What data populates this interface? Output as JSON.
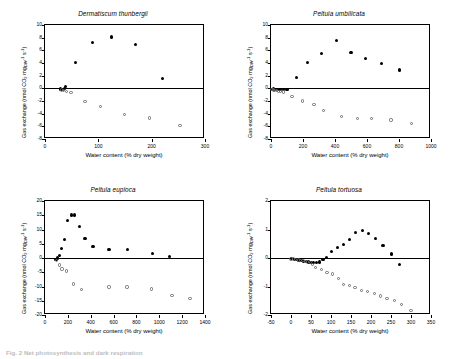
{
  "figure": {
    "caption_fragment": "Fig. 2 Net photosynthesis and dark respiration"
  },
  "axis_titles": {
    "x": "Water content (% dry weight)",
    "y_prefix": "Gas exchange (nmol CO",
    "y_sub1": "2",
    "y_mid": " mg",
    "y_sub2": "DW",
    "y_sup1": "-1",
    "y_s": " s",
    "y_sup2": "-1",
    "y_suffix": ")"
  },
  "chart_data": [
    {
      "type": "scatter",
      "title": "Dermatiscum thunbergii",
      "xlabel": "Water content (% dry weight)",
      "ylabel": "Gas exchange (nmol CO2 mgDW-1 s-1)",
      "xlim": [
        0,
        300
      ],
      "ylim": [
        -8,
        10
      ],
      "xticks": [
        0,
        100,
        200,
        300
      ],
      "yticks": [
        -8,
        -6,
        -4,
        -2,
        0,
        2,
        4,
        6,
        8,
        10
      ],
      "grid": false,
      "legend": "none",
      "series": [
        {
          "name": "Net photosynthesis",
          "marker": "filled-circle",
          "points": [
            [
              29,
              -0.1
            ],
            [
              33,
              -0.15
            ],
            [
              36,
              0.0
            ],
            [
              39,
              0.3
            ],
            [
              58,
              4.15
            ],
            [
              89,
              7.25
            ],
            [
              124,
              8.1
            ],
            [
              170,
              6.9
            ],
            [
              221,
              1.55
            ]
          ]
        },
        {
          "name": "Dark respiration",
          "marker": "open-circle",
          "points": [
            [
              31,
              -0.25
            ],
            [
              35,
              -0.3
            ],
            [
              40,
              -0.55
            ],
            [
              49,
              -0.65
            ],
            [
              75,
              -2.05
            ],
            [
              104,
              -2.85
            ],
            [
              149,
              -4.1
            ],
            [
              196,
              -4.7
            ],
            [
              253,
              -5.85
            ]
          ]
        }
      ]
    },
    {
      "type": "scatter",
      "title": "Peltula umbilicata",
      "xlabel": "Water content (% dry weight)",
      "ylabel": "Gas exchange (nmol CO2 mgDW-1 s-1)",
      "xlim": [
        0,
        1000
      ],
      "ylim": [
        -8,
        10
      ],
      "xticks": [
        0,
        200,
        400,
        600,
        800,
        1000
      ],
      "yticks": [
        -8,
        -6,
        -4,
        -2,
        0,
        2,
        4,
        6,
        8,
        10
      ],
      "grid": false,
      "legend": "none",
      "series": [
        {
          "name": "Net photosynthesis",
          "marker": "filled-circle",
          "points": [
            [
              8,
              -0.15
            ],
            [
              18,
              -0.1
            ],
            [
              30,
              -0.15
            ],
            [
              45,
              -0.2
            ],
            [
              62,
              -0.2
            ],
            [
              80,
              -0.25
            ],
            [
              100,
              -0.2
            ],
            [
              157,
              1.65
            ],
            [
              228,
              4.1
            ],
            [
              318,
              5.55
            ],
            [
              408,
              7.55
            ],
            [
              500,
              5.65
            ],
            [
              590,
              4.7
            ],
            [
              690,
              3.9
            ],
            [
              805,
              2.9
            ]
          ]
        },
        {
          "name": "Dark respiration",
          "marker": "open-circle",
          "points": [
            [
              6,
              -0.2
            ],
            [
              14,
              -0.25
            ],
            [
              24,
              -0.3
            ],
            [
              34,
              -0.35
            ],
            [
              48,
              -0.45
            ],
            [
              60,
              -0.5
            ],
            [
              78,
              -0.6
            ],
            [
              132,
              -1.25
            ],
            [
              196,
              -2.0
            ],
            [
              268,
              -2.6
            ],
            [
              330,
              -3.45
            ],
            [
              440,
              -4.5
            ],
            [
              540,
              -4.8
            ],
            [
              630,
              -4.8
            ],
            [
              750,
              -5.0
            ],
            [
              880,
              -5.55
            ]
          ]
        }
      ]
    },
    {
      "type": "scatter",
      "title": "Peltula euploca",
      "xlabel": "Water content (% dry weight)",
      "ylabel": "Gas exchange (nmol CO2 mgDW-1 s-1)",
      "xlim": [
        0,
        1400
      ],
      "ylim": [
        -20,
        20
      ],
      "xticks": [
        0,
        200,
        400,
        600,
        800,
        1000,
        1200,
        1400
      ],
      "yticks": [
        -20,
        -15,
        -10,
        -5,
        0,
        5,
        10,
        15,
        20
      ],
      "grid": false,
      "legend": "none",
      "series": [
        {
          "name": "Net photosynthesis",
          "marker": "filled-circle",
          "points": [
            [
              96,
              -0.5
            ],
            [
              112,
              0.0
            ],
            [
              128,
              1.0
            ],
            [
              146,
              3.4
            ],
            [
              168,
              6.6
            ],
            [
              196,
              13.0
            ],
            [
              232,
              15.1
            ],
            [
              262,
              15.1
            ],
            [
              300,
              11.2
            ],
            [
              350,
              7.0
            ],
            [
              420,
              3.9
            ],
            [
              560,
              3.0
            ],
            [
              720,
              2.9
            ],
            [
              940,
              1.6
            ],
            [
              1090,
              0.5
            ]
          ]
        },
        {
          "name": "Dark respiration",
          "marker": "open-circle",
          "points": [
            [
              100,
              -0.9
            ],
            [
              126,
              -2.5
            ],
            [
              150,
              -3.9
            ],
            [
              186,
              -4.6
            ],
            [
              252,
              -9.1
            ],
            [
              322,
              -11.0
            ],
            [
              560,
              -10.2
            ],
            [
              718,
              -10.2
            ],
            [
              930,
              -10.9
            ],
            [
              1110,
              -13.1
            ],
            [
              1270,
              -14.1
            ]
          ]
        }
      ]
    },
    {
      "type": "scatter",
      "title": "Peltula tortuosa",
      "xlabel": "Water content (% dry weight)",
      "ylabel": "Gas exchange (nmol CO2 mgDW-1 s-1)",
      "xlim": [
        -50,
        350
      ],
      "ylim": [
        -2,
        2
      ],
      "xticks": [
        -50,
        0,
        50,
        100,
        150,
        200,
        250,
        300,
        350
      ],
      "yticks": [
        -2,
        -1,
        0,
        1,
        2
      ],
      "grid": false,
      "legend": "none",
      "series": [
        {
          "name": "Net photosynthesis",
          "marker": "filled-circle",
          "points": [
            [
              2,
              -0.03
            ],
            [
              8,
              -0.04
            ],
            [
              14,
              -0.06
            ],
            [
              20,
              -0.08
            ],
            [
              26,
              -0.09
            ],
            [
              32,
              -0.11
            ],
            [
              38,
              -0.13
            ],
            [
              44,
              -0.14
            ],
            [
              50,
              -0.16
            ],
            [
              57,
              -0.17
            ],
            [
              64,
              -0.17
            ],
            [
              72,
              -0.14
            ],
            [
              80,
              -0.05
            ],
            [
              88,
              0.02
            ],
            [
              102,
              0.22
            ],
            [
              116,
              0.36
            ],
            [
              132,
              0.47
            ],
            [
              146,
              0.64
            ],
            [
              162,
              0.9
            ],
            [
              178,
              0.95
            ],
            [
              194,
              0.87
            ],
            [
              212,
              0.67
            ],
            [
              230,
              0.44
            ],
            [
              252,
              0.14
            ],
            [
              272,
              -0.24
            ]
          ]
        },
        {
          "name": "Dark respiration",
          "marker": "open-circle",
          "points": [
            [
              0,
              -0.03
            ],
            [
              6,
              -0.04
            ],
            [
              12,
              -0.06
            ],
            [
              18,
              -0.07
            ],
            [
              24,
              -0.09
            ],
            [
              30,
              -0.1
            ],
            [
              36,
              -0.12
            ],
            [
              42,
              -0.14
            ],
            [
              48,
              -0.16
            ],
            [
              54,
              -0.23
            ],
            [
              62,
              -0.33
            ],
            [
              76,
              -0.4
            ],
            [
              90,
              -0.5
            ],
            [
              104,
              -0.56
            ],
            [
              118,
              -0.72
            ],
            [
              132,
              -0.92
            ],
            [
              146,
              -0.96
            ],
            [
              160,
              -1.04
            ],
            [
              176,
              -1.14
            ],
            [
              192,
              -1.18
            ],
            [
              208,
              -1.25
            ],
            [
              224,
              -1.33
            ],
            [
              240,
              -1.43
            ],
            [
              258,
              -1.5
            ],
            [
              276,
              -1.62
            ],
            [
              300,
              -1.85
            ]
          ]
        }
      ]
    }
  ]
}
